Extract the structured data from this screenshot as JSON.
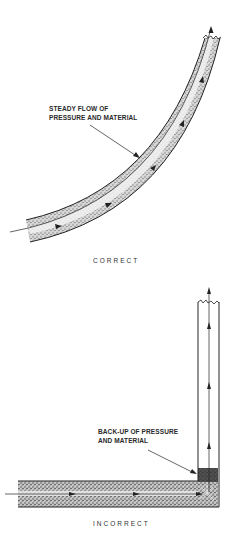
{
  "figure": {
    "correct": {
      "callout_line1": "STEADY FLOW OF",
      "callout_line2": "PRESSURE AND MATERIAL",
      "caption": "CORRECT",
      "pipe_shape": "smooth-curved-bend",
      "flow_direction": "left-to-up"
    },
    "incorrect": {
      "callout_line1": "BACK-UP OF PRESSURE",
      "callout_line2": "AND MATERIAL",
      "caption": "INCORRECT",
      "pipe_shape": "sharp-90-degree-bend",
      "flow_direction": "left-to-up"
    },
    "colors": {
      "ink": "#222222",
      "stipple": "#9a9a9a",
      "background": "#ffffff"
    }
  }
}
